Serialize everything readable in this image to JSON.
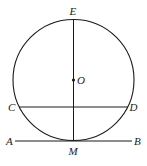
{
  "diagram": {
    "colors": {
      "stroke": "#1a1a1a",
      "label": "#222222",
      "background": "#ffffff"
    },
    "circle": {
      "center_label": "O",
      "cx": 73.5,
      "cy": 80,
      "r": 60.5
    },
    "points": {
      "E": {
        "label": "E",
        "x": 73.5,
        "y": 19.5
      },
      "O": {
        "label": "O",
        "x": 73.5,
        "y": 80
      },
      "C": {
        "label": "C",
        "x": 19,
        "y": 107
      },
      "D": {
        "label": "D",
        "x": 128,
        "y": 107
      },
      "A": {
        "label": "A",
        "x": 15,
        "y": 141
      },
      "B": {
        "label": "B",
        "x": 132,
        "y": 141
      },
      "M": {
        "label": "M",
        "x": 73.5,
        "y": 141
      }
    },
    "segments": [
      {
        "name": "EM",
        "from": "E",
        "to": "M"
      },
      {
        "name": "CD",
        "from": "C",
        "to": "D"
      },
      {
        "name": "AB",
        "from": "A",
        "to": "B"
      }
    ]
  }
}
